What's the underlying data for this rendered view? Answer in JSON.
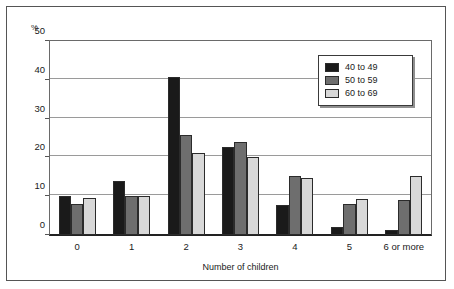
{
  "chart_data": {
    "type": "bar",
    "title": "",
    "xlabel": "Number of children",
    "ylabel": "%",
    "ylim": [
      0,
      50
    ],
    "yticks": [
      0,
      10,
      20,
      30,
      40,
      50
    ],
    "ytick_labels": [
      "0",
      "10",
      "20",
      "30",
      "40",
      "50"
    ],
    "grid": true,
    "grid_axis": "y",
    "legend_position": "top-right",
    "categories": [
      "0",
      "1",
      "2",
      "3",
      "4",
      "5",
      "6 or more"
    ],
    "series": [
      {
        "name": "40 to 49",
        "color": "#1a1a1a",
        "values": [
          10.0,
          13.8,
          40.6,
          22.8,
          7.8,
          2.0,
          1.3
        ]
      },
      {
        "name": "50 to 59",
        "color": "#6e6e6e",
        "values": [
          8.0,
          10.0,
          25.8,
          24.1,
          15.1,
          8.0,
          9.0
        ]
      },
      {
        "name": "60 to 69",
        "color": "#d8d8d8",
        "values": [
          9.5,
          10.0,
          21.2,
          20.0,
          14.7,
          9.3,
          15.3
        ]
      }
    ]
  },
  "legend": {
    "entries": [
      {
        "label": "40 to 49",
        "color": "#1a1a1a"
      },
      {
        "label": "50 to 59",
        "color": "#6e6e6e"
      },
      {
        "label": "60 to 69",
        "color": "#d8d8d8"
      }
    ]
  },
  "axes": {
    "y_unit": "%",
    "x_title": "Number of children"
  },
  "colors": {
    "frame": "#555555",
    "plot_border": "#6a6a6a",
    "baseline": "#222222",
    "gridline": "#9a9a9a",
    "text": "#1a1a1a",
    "background": "#ffffff"
  }
}
